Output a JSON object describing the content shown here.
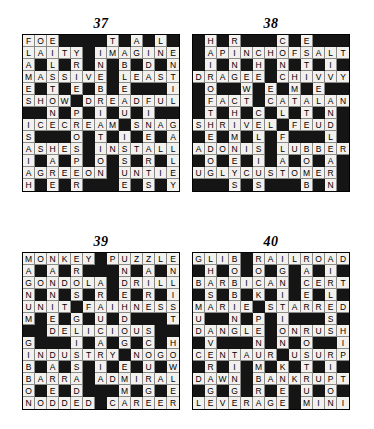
{
  "page": {
    "background_color": "#ffffff",
    "white_cell_color": "#f2f1ee",
    "black_cell_color": "#151515",
    "text_color": "#000000"
  },
  "puzzles": [
    {
      "number": "37",
      "rows": 13,
      "cols": 13,
      "grid": [
        [
          "F",
          "O",
          "E",
          "",
          "",
          "",
          "",
          "T",
          "",
          "A",
          "",
          "L",
          ""
        ],
        [
          "L",
          "A",
          "I",
          "T",
          "Y",
          "",
          "I",
          "M",
          "A",
          "G",
          "I",
          "N",
          "E"
        ],
        [
          "A",
          "",
          "L",
          "",
          "R",
          "",
          "N",
          "",
          "B",
          "",
          "D",
          "",
          "N"
        ],
        [
          "M",
          "A",
          "S",
          "S",
          "I",
          "V",
          "E",
          "",
          "L",
          "E",
          "A",
          "S",
          "T"
        ],
        [
          "E",
          "",
          "T",
          "",
          "E",
          "",
          "B",
          "",
          "E",
          "",
          "",
          "",
          "I"
        ],
        [
          "S",
          "H",
          "O",
          "W",
          "",
          "D",
          "R",
          "E",
          "A",
          "D",
          "F",
          "U",
          "L"
        ],
        [
          "",
          "",
          "N",
          "",
          "P",
          "",
          "I",
          "",
          "U",
          "",
          "I",
          "",
          ""
        ],
        [
          "I",
          "C",
          "E",
          "C",
          "R",
          "E",
          "A",
          "M",
          "",
          "S",
          "N",
          "A",
          "G"
        ],
        [
          "S",
          "",
          "",
          "",
          "O",
          "",
          "T",
          "",
          "I",
          "",
          "E",
          "",
          "A"
        ],
        [
          "A",
          "S",
          "H",
          "E",
          "S",
          "",
          "I",
          "N",
          "S",
          "T",
          "A",
          "L",
          "L"
        ],
        [
          "I",
          "",
          "A",
          "",
          "P",
          "",
          "O",
          "",
          "S",
          "",
          "R",
          "",
          "L"
        ],
        [
          "A",
          "G",
          "R",
          "E",
          "E",
          "O",
          "N",
          "",
          "U",
          "N",
          "T",
          "I",
          "E"
        ],
        [
          "H",
          "",
          "E",
          "",
          "R",
          "",
          "",
          "",
          "E",
          "",
          "S",
          "",
          "Y"
        ]
      ]
    },
    {
      "number": "38",
      "rows": 13,
      "cols": 13,
      "grid": [
        [
          "",
          "H",
          "",
          "R",
          "",
          "",
          "",
          "C",
          "",
          "E",
          "",
          "",
          ""
        ],
        [
          "",
          "A",
          "P",
          "I",
          "N",
          "C",
          "H",
          "O",
          "F",
          "S",
          "A",
          "L",
          "T"
        ],
        [
          "",
          "I",
          "",
          "N",
          "",
          "H",
          "",
          "N",
          "",
          "T",
          "",
          "I",
          ""
        ],
        [
          "D",
          "R",
          "A",
          "G",
          "E",
          "E",
          "",
          "C",
          "H",
          "I",
          "V",
          "V",
          "Y"
        ],
        [
          "",
          "O",
          "",
          "",
          "W",
          "",
          "E",
          "",
          "M",
          "",
          "E",
          "",
          ""
        ],
        [
          "",
          "F",
          "A",
          "C",
          "T",
          "",
          "C",
          "A",
          "T",
          "A",
          "L",
          "A",
          "N"
        ],
        [
          "",
          "T",
          "",
          "H",
          "",
          "C",
          "",
          "L",
          "",
          "T",
          "",
          "N",
          ""
        ],
        [
          "S",
          "H",
          "R",
          "I",
          "V",
          "E",
          "L",
          "",
          "F",
          "E",
          "U",
          "D",
          ""
        ],
        [
          "",
          "E",
          "",
          "M",
          "",
          "L",
          "",
          "F",
          "",
          "",
          "",
          "L",
          ""
        ],
        [
          "A",
          "D",
          "O",
          "N",
          "I",
          "S",
          "",
          "L",
          "U",
          "B",
          "B",
          "E",
          "R"
        ],
        [
          "",
          "O",
          "",
          "E",
          "",
          "I",
          "",
          "A",
          "",
          "O",
          "",
          "A",
          ""
        ],
        [
          "U",
          "G",
          "L",
          "Y",
          "C",
          "U",
          "S",
          "T",
          "O",
          "M",
          "E",
          "R",
          ""
        ],
        [
          "",
          "",
          "",
          "S",
          "",
          "S",
          "",
          "",
          "",
          "B",
          "",
          "N",
          ""
        ]
      ]
    },
    {
      "number": "39",
      "rows": 13,
      "cols": 13,
      "grid": [
        [
          "M",
          "O",
          "N",
          "K",
          "E",
          "Y",
          "",
          "P",
          "U",
          "Z",
          "Z",
          "L",
          "E"
        ],
        [
          "A",
          "",
          "A",
          "",
          "R",
          "",
          "",
          "",
          "N",
          "",
          "A",
          "",
          "N"
        ],
        [
          "G",
          "O",
          "N",
          "D",
          "O",
          "L",
          "A",
          "",
          "D",
          "R",
          "I",
          "L",
          "L"
        ],
        [
          "N",
          "",
          "N",
          "",
          "S",
          "",
          "R",
          "",
          "E",
          "",
          "R",
          "",
          "I"
        ],
        [
          "U",
          "N",
          "I",
          "T",
          "",
          "F",
          "A",
          "I",
          "H",
          "N",
          "E",
          "S",
          "S"
        ],
        [
          "M",
          "",
          "E",
          "",
          "G",
          "",
          "U",
          "",
          "D",
          "",
          "",
          "",
          "T"
        ],
        [
          "",
          "",
          "D",
          "E",
          "L",
          "I",
          "C",
          "I",
          "O",
          "U",
          "S",
          "",
          ""
        ],
        [
          "G",
          "",
          "",
          "",
          "I",
          "",
          "A",
          "",
          "G",
          "",
          "C",
          "",
          "H"
        ],
        [
          "I",
          "N",
          "D",
          "U",
          "S",
          "T",
          "R",
          "Y",
          "",
          "N",
          "O",
          "G",
          "O"
        ],
        [
          "B",
          "",
          "A",
          "",
          "S",
          "",
          "I",
          "",
          "E",
          "",
          "U",
          "",
          "W"
        ],
        [
          "B",
          "A",
          "R",
          "R",
          "A",
          "",
          "A",
          "D",
          "M",
          "I",
          "R",
          "A",
          "L"
        ],
        [
          "O",
          "",
          "E",
          "",
          "D",
          "",
          "",
          "",
          "M",
          "",
          "G",
          "",
          "E"
        ],
        [
          "N",
          "O",
          "D",
          "D",
          "E",
          "D",
          "",
          "C",
          "A",
          "R",
          "E",
          "E",
          "R"
        ]
      ]
    },
    {
      "number": "40",
      "rows": 13,
      "cols": 13,
      "grid": [
        [
          "G",
          "L",
          "I",
          "B",
          "",
          "R",
          "A",
          "I",
          "L",
          "R",
          "O",
          "A",
          "D"
        ],
        [
          "",
          "H",
          "",
          "O",
          "",
          "O",
          "",
          "G",
          "",
          "A",
          "",
          "I",
          ""
        ],
        [
          "B",
          "A",
          "R",
          "B",
          "I",
          "C",
          "A",
          "N",
          "",
          "C",
          "E",
          "R",
          "T"
        ],
        [
          "",
          "S",
          "",
          "B",
          "",
          "K",
          "",
          "I",
          "",
          "E",
          "",
          "L",
          ""
        ],
        [
          "M",
          "A",
          "R",
          "I",
          "E",
          "",
          "S",
          "T",
          "A",
          "R",
          "R",
          "E",
          "D"
        ],
        [
          "U",
          "",
          "",
          "N",
          "",
          "P",
          "",
          "I",
          "",
          "",
          "",
          "S",
          ""
        ],
        [
          "D",
          "A",
          "N",
          "G",
          "L",
          "E",
          "",
          "O",
          "N",
          "R",
          "U",
          "S",
          "H"
        ],
        [
          "",
          "V",
          "",
          "",
          "",
          "N",
          "",
          "N",
          "",
          "O",
          "",
          "",
          "I"
        ],
        [
          "C",
          "E",
          "N",
          "T",
          "A",
          "U",
          "R",
          "",
          "U",
          "S",
          "U",
          "R",
          "P"
        ],
        [
          "",
          "R",
          "",
          "I",
          "",
          "M",
          "",
          "K",
          "",
          "T",
          "",
          "I",
          ""
        ],
        [
          "D",
          "A",
          "W",
          "N",
          "",
          "B",
          "A",
          "N",
          "K",
          "R",
          "U",
          "P",
          "T"
        ],
        [
          "",
          "G",
          "",
          "G",
          "",
          "R",
          "",
          "E",
          "",
          "U",
          "",
          "O",
          ""
        ],
        [
          "L",
          "E",
          "V",
          "E",
          "R",
          "A",
          "G",
          "E",
          "",
          "M",
          "I",
          "N",
          "I"
        ]
      ]
    }
  ]
}
